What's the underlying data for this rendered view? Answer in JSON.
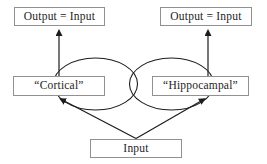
{
  "diagram": {
    "boxes": {
      "output_left": {
        "label": "Output = Input"
      },
      "output_right": {
        "label": "Output = Input"
      },
      "cortical": {
        "label": "“Cortical”"
      },
      "hippocampal": {
        "label": "“Hippocampal”"
      },
      "input": {
        "label": "Input"
      }
    },
    "edges": [
      {
        "from": "input",
        "to": "cortical",
        "type": "arrow"
      },
      {
        "from": "input",
        "to": "hippocampal",
        "type": "arrow"
      },
      {
        "from": "cortical",
        "to": "output_left",
        "type": "arrow"
      },
      {
        "from": "hippocampal",
        "to": "output_right",
        "type": "arrow"
      },
      {
        "from": "cortical",
        "to": "cortical",
        "type": "recurrent-loop"
      },
      {
        "from": "hippocampal",
        "to": "hippocampal",
        "type": "recurrent-loop"
      }
    ],
    "colors": {
      "background": "#ffffff",
      "line": "#1c1c1c",
      "box_border": "#919191",
      "text": "#1d1d1d"
    }
  }
}
